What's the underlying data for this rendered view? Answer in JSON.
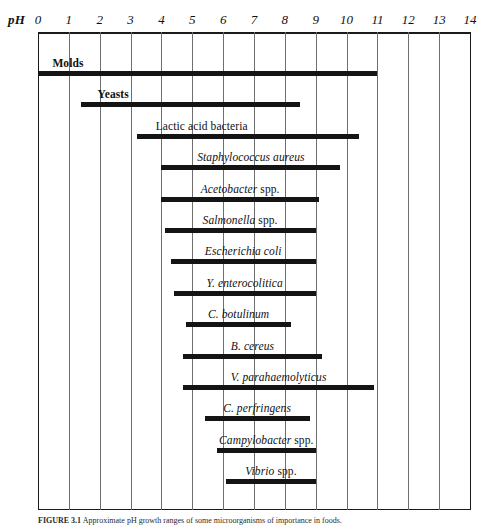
{
  "axis": {
    "name": "pH",
    "ticks": [
      "0",
      "1",
      "2",
      "3",
      "4",
      "5",
      "6",
      "7",
      "8",
      "9",
      "10",
      "11",
      "12",
      "13",
      "14"
    ]
  },
  "caption": {
    "prefix": "FIGURE 3.1",
    "text": "  Approximate pH growth ranges of some microorganisms of importance in foods."
  },
  "chart_data": {
    "type": "bar",
    "orientation": "horizontal",
    "xlabel": "pH",
    "ylabel": "",
    "xlim": [
      0,
      14
    ],
    "xticks": [
      0,
      1,
      2,
      3,
      4,
      5,
      6,
      7,
      8,
      9,
      10,
      11,
      12,
      13,
      14
    ],
    "grid": true,
    "legend": "none",
    "value_type": "range",
    "categories": [
      "Molds",
      "Yeasts",
      "Lactic acid bacteria",
      "Staphylococcus aureus",
      "Acetobacter spp.",
      "Salmonella spp.",
      "Escherichia coli",
      "Y. enterocolitica",
      "C. botulinum",
      "B. cereus",
      "V. parahaemolyticus",
      "C. perfringens",
      "Campylobacter spp.",
      "Vibrio spp."
    ],
    "ranges": [
      {
        "label": "Molds",
        "min": 0.0,
        "max": 11.0
      },
      {
        "label": "Yeasts",
        "min": 1.4,
        "max": 8.5
      },
      {
        "label": "Lactic acid bacteria",
        "min": 3.2,
        "max": 10.4
      },
      {
        "label": "Staphylococcus aureus",
        "min": 4.0,
        "max": 9.8
      },
      {
        "label": "Acetobacter spp.",
        "min": 4.0,
        "max": 9.1
      },
      {
        "label": "Salmonella spp.",
        "min": 4.1,
        "max": 9.0
      },
      {
        "label": "Escherichia coli",
        "min": 4.3,
        "max": 9.0
      },
      {
        "label": "Y. enterocolitica",
        "min": 4.4,
        "max": 9.0
      },
      {
        "label": "C. botulinum",
        "min": 4.8,
        "max": 8.2
      },
      {
        "label": "B. cereus",
        "min": 4.7,
        "max": 9.2
      },
      {
        "label": "V. parahaemolyticus",
        "min": 4.7,
        "max": 10.9
      },
      {
        "label": "C. perfringens",
        "min": 5.4,
        "max": 8.8
      },
      {
        "label": "Campylobacter spp.",
        "min": 5.8,
        "max": 9.0
      },
      {
        "label": "Vibrio spp.",
        "min": 6.1,
        "max": 9.0
      }
    ]
  },
  "rows": [
    {
      "label": "Molds",
      "style": "bold",
      "tail": ""
    },
    {
      "label": "Yeasts",
      "style": "bold",
      "tail": ""
    },
    {
      "label": "Lactic acid bacteria",
      "style": "plain",
      "tail": ""
    },
    {
      "label": "Staphylococcus aureus",
      "style": "italic",
      "tail": ""
    },
    {
      "label": "Acetobacter",
      "style": "italic",
      "tail": " spp."
    },
    {
      "label": "Salmonella",
      "style": "italic",
      "tail": " spp."
    },
    {
      "label": "Escherichia coli",
      "style": "italic",
      "tail": ""
    },
    {
      "label": "Y. enterocolitica",
      "style": "italic",
      "tail": ""
    },
    {
      "label": "C. botulinum",
      "style": "italic",
      "tail": ""
    },
    {
      "label": "B. cereus",
      "style": "italic",
      "tail": ""
    },
    {
      "label": "V. parahaemolyticus",
      "style": "italic",
      "tail": ""
    },
    {
      "label": "C. perfringens",
      "style": "italic",
      "tail": ""
    },
    {
      "label": "Campylobacter",
      "style": "italic",
      "tail": " spp."
    },
    {
      "label": "Vibrio",
      "style": "italic",
      "tail": " spp."
    }
  ]
}
